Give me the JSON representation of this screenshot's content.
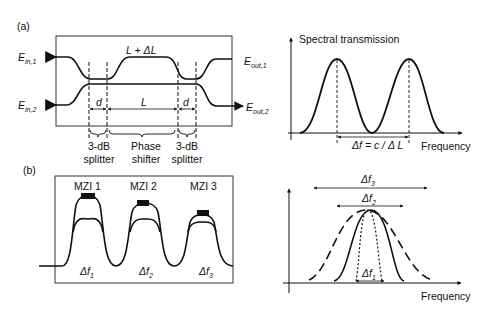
{
  "panel_a": {
    "label": "(a)",
    "mzi": {
      "inputs": [
        "E",
        "E"
      ],
      "input_subs": [
        "in,1",
        "in,2"
      ],
      "outputs": [
        "E",
        "E"
      ],
      "output_subs": [
        "out,1",
        "out,2"
      ],
      "top_arm_label": "L + ΔL",
      "d_left": "d",
      "L_label": "L",
      "d_right": "d",
      "sections": [
        "3-dB\nsplitter",
        "Phase\nshifter",
        "3-dB\nsplitter"
      ],
      "section_line1": [
        "3-dB",
        "Phase",
        "3-dB"
      ],
      "section_line2": [
        "splitter",
        "shifter",
        "splitter"
      ]
    },
    "spectrum": {
      "ylabel": "Spectral transmission",
      "xlabel": "Frequency",
      "spacing_label": "Δf = c / Δ L"
    }
  },
  "panel_b": {
    "label": "(b)",
    "stages": [
      {
        "name": "MZI 1",
        "df": "Δf",
        "sub": "1"
      },
      {
        "name": "MZI 2",
        "df": "Δf",
        "sub": "2"
      },
      {
        "name": "MZI 3",
        "df": "Δf",
        "sub": "3"
      }
    ],
    "passband": {
      "xlabel": "Frequency",
      "widths": [
        {
          "label": "Δf",
          "sub": "3",
          "style": "long-dash"
        },
        {
          "label": "Δf",
          "sub": "2",
          "style": "solid"
        },
        {
          "label": "Δf",
          "sub": "1",
          "style": "short-dash"
        }
      ]
    }
  }
}
